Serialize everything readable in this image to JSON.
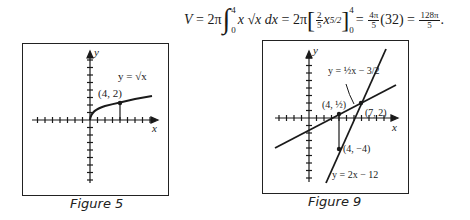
{
  "formula": {
    "lhs": "V",
    "eq1": "=",
    "coef1": "2π",
    "int_upper": "4",
    "int_lower": "0",
    "integrand": "x √x dx",
    "eq2": "=",
    "coef2": "2π",
    "frac_num": "2",
    "frac_den": "5",
    "antideriv_base": "x",
    "antideriv_exp": "5/2",
    "eval_upper": "4",
    "eval_lower": "0",
    "eq3": "=",
    "step_frac_num": "4π",
    "step_frac_den": "5",
    "step_paren": "(32)",
    "eq4": "=",
    "result_num": "128π",
    "result_den": "5",
    "end": "."
  },
  "figure5": {
    "caption": "Figure 5",
    "x_label": "x",
    "y_label": "y",
    "curve_label": "y = √x",
    "point_label": "(4, 2)"
  },
  "figure9": {
    "caption": "Figure 9",
    "x_label": "x",
    "y_label": "y",
    "line1_label": "y = ½x − 3/2",
    "line2_label": "y = 2x − 12",
    "point1_label": "(4, ½)",
    "point2_label": "(7, 2)",
    "point3_label": "(4, −4)"
  }
}
